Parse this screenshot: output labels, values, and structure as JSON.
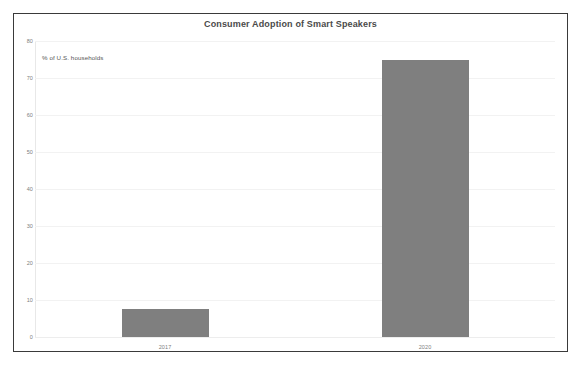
{
  "chart_data": {
    "type": "bar",
    "title": "Consumer Adoption of Smart Speakers",
    "subtitle": "% of U.S. households",
    "categories": [
      "2017",
      "2020"
    ],
    "values": [
      7.5,
      75
    ],
    "xlabel": "",
    "ylabel": "",
    "ylim": [
      0,
      80
    ],
    "yticks": [
      "0",
      "10",
      "20",
      "30",
      "40",
      "50",
      "60",
      "70",
      "80"
    ],
    "ytick_values": [
      0,
      10,
      20,
      30,
      40,
      50,
      60,
      70,
      80
    ],
    "grid": true,
    "legend": "none",
    "series": [
      {
        "name": "% of U.S. households",
        "values": [
          7.5,
          75
        ],
        "color": "#7f7f7f"
      }
    ]
  },
  "colors": {
    "bar": "#7f7f7f",
    "frame_border": "#3a3a3a",
    "gridline": "#f2f2f2",
    "title_text": "#4a4a4a",
    "tick_text": "#808080",
    "background": "#ffffff"
  }
}
